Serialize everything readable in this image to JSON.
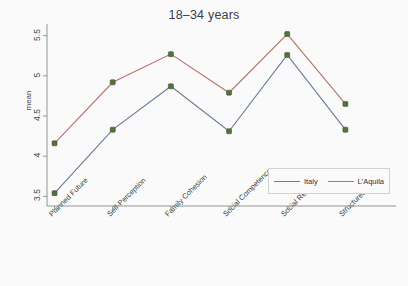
{
  "chart_data": {
    "type": "line",
    "title": "18–34 years",
    "xlabel": "",
    "ylabel": "mean",
    "categories": [
      "Planned Future",
      "Self-Perception",
      "Family Cohesion",
      "Social Competence",
      "Social Resources",
      "Structured Style"
    ],
    "yticks": [
      "3.5",
      "4",
      "4.5",
      "5",
      "5.5"
    ],
    "ytick_values": [
      3.5,
      4,
      4.5,
      5,
      5.5
    ],
    "ylim": [
      3.38,
      5.62
    ],
    "grid": false,
    "legend_position": "bottom-right",
    "series": [
      {
        "name": "Italy",
        "color": "#6a7a96",
        "values": [
          3.54,
          4.33,
          4.87,
          4.31,
          5.26,
          4.33
        ]
      },
      {
        "name": "L'Aquila",
        "color": "#b5746a",
        "values": [
          4.16,
          4.92,
          5.27,
          4.79,
          5.52,
          4.65
        ]
      }
    ],
    "marker_color": "#55703d",
    "marker_edge_color": "#41552e",
    "axis_color": "#8a8a8a",
    "background": "#fafafa",
    "title_color": "#3c3c48"
  }
}
